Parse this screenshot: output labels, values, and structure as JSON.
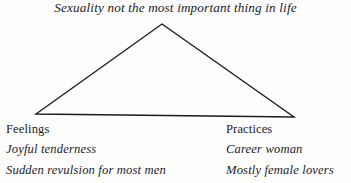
{
  "diagram": {
    "title": "Sexuality not the most important thing in life",
    "shape": "triangle",
    "stroke_color": "#1c1c1f",
    "background_color": "#fefefe",
    "vertices": {
      "apex": {
        "x": 162,
        "y": 24
      },
      "base_left": {
        "x": 36,
        "y": 114
      },
      "base_right": {
        "x": 294,
        "y": 117
      }
    },
    "columns": [
      {
        "heading": "Feelings",
        "items": [
          "Joyful tenderness",
          "Sudden revulsion for most men"
        ]
      },
      {
        "heading": "Practices",
        "items": [
          "Career woman",
          "Mostly female lovers"
        ]
      }
    ]
  }
}
